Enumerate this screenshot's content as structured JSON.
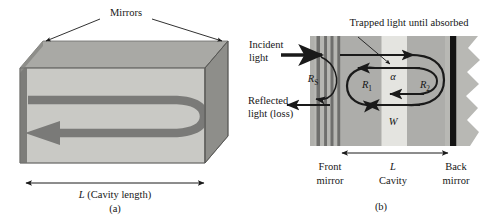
{
  "figure": {
    "panels": [
      {
        "id": "a",
        "caption": "(a)",
        "title_label": "Mirrors",
        "length_label": "L",
        "length_label_rest": " (Cavity length)",
        "description": "Three-dimensional cavity block with mirrors on the two end faces and a looping light beam inside"
      },
      {
        "id": "b",
        "caption": "(b)",
        "trapped_label": "Trapped light until absorbed",
        "incident_line1": "Incident",
        "incident_line2": "light",
        "reflected_line1": "Reflected",
        "reflected_line2": "light (loss)",
        "rs_symbol": "R",
        "rs_subscript": "S",
        "r1_symbol": "R",
        "r1_subscript": "1",
        "r2_symbol": "R",
        "r2_subscript": "2",
        "alpha_symbol": "α",
        "w_symbol": "W",
        "bottom_labels": [
          {
            "line1": "Front",
            "line2": "mirror"
          },
          {
            "line1": "L",
            "line2": "Cavity"
          },
          {
            "line1": "Back",
            "line2": "mirror"
          }
        ]
      }
    ]
  },
  "colors": {
    "front_face": "#c9c9c5",
    "top_face": "#a9a9a5",
    "side_face": "#8e8e8a",
    "left_edge": "#6e6e6b",
    "beam": "#7a7a78",
    "stripe_dark": "#6f6f6d",
    "stripe_mid": "#b3b3b0",
    "cavity_light": "#e2e2de",
    "substrate": "#b8b8b4",
    "back_mirror": "#141414",
    "line": "#1a1a1a",
    "background": "#ffffff"
  }
}
